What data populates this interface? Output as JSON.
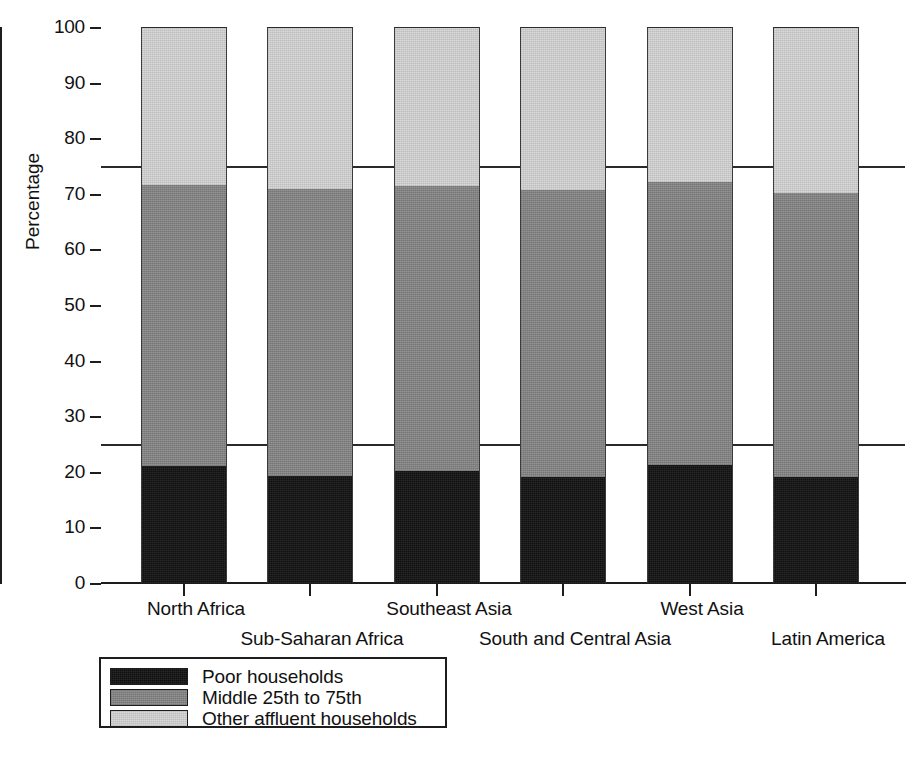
{
  "chart_data": {
    "type": "bar",
    "subtype": "stacked-100-percent",
    "title": "",
    "xlabel": "",
    "ylabel": "Percentage",
    "ylim": [
      0,
      100
    ],
    "yticks": [
      0,
      10,
      20,
      30,
      40,
      50,
      60,
      70,
      80,
      90,
      100
    ],
    "ytick_labels": [
      "0",
      "10",
      "20",
      "30",
      "40",
      "50",
      "60",
      "70",
      "80",
      "90",
      "100"
    ],
    "grid": false,
    "reference_lines": [
      25,
      75
    ],
    "legend_position": "below-left",
    "categories": [
      "North Africa",
      "Sub-Saharan Africa",
      "Southeast Asia",
      "South and Central Asia",
      "West Asia",
      "Latin America"
    ],
    "series": [
      {
        "name": "Poor households",
        "color": "#111111",
        "values": [
          21.0,
          19.2,
          20.1,
          19.1,
          21.3,
          19.0
        ]
      },
      {
        "name": "Middle 25th to 75th",
        "color": "#878787",
        "values": [
          50.5,
          51.6,
          51.3,
          51.6,
          50.8,
          51.1
        ]
      },
      {
        "name": "Other affluent households",
        "color": "#d3d3d3",
        "values": [
          28.5,
          29.2,
          28.6,
          29.3,
          27.9,
          29.9
        ]
      }
    ],
    "cumulative_tops": [
      [
        21.0,
        71.5,
        100
      ],
      [
        19.2,
        70.8,
        100
      ],
      [
        20.1,
        71.4,
        100
      ],
      [
        19.1,
        70.7,
        100
      ],
      [
        21.3,
        72.1,
        100
      ],
      [
        19.0,
        70.1,
        100
      ]
    ]
  },
  "axis": {
    "y_title": "Percentage",
    "y_ticks": [
      {
        "value": 100,
        "label": "100"
      },
      {
        "value": 90,
        "label": "90"
      },
      {
        "value": 80,
        "label": "80"
      },
      {
        "value": 70,
        "label": "70"
      },
      {
        "value": 60,
        "label": "60"
      },
      {
        "value": 50,
        "label": "50"
      },
      {
        "value": 40,
        "label": "40"
      },
      {
        "value": 30,
        "label": "30"
      },
      {
        "value": 20,
        "label": "20"
      },
      {
        "value": 10,
        "label": "10"
      },
      {
        "value": 0,
        "label": "0"
      }
    ]
  },
  "categories_layout": [
    {
      "label": "North Africa",
      "row": "a",
      "center_px": 196
    },
    {
      "label": "Sub-Saharan Africa",
      "row": "b",
      "center_px": 322
    },
    {
      "label": "Southeast Asia",
      "row": "a",
      "center_px": 449
    },
    {
      "label": "South and Central Asia",
      "row": "b",
      "center_px": 575
    },
    {
      "label": "West Asia",
      "row": "a",
      "center_px": 702
    },
    {
      "label": "Latin America",
      "row": "b",
      "center_px": 828
    }
  ],
  "legend": {
    "items": [
      {
        "label": "Poor households",
        "color": "#111111",
        "swatch": "poor-swatch"
      },
      {
        "label": "Middle 25th to 75th",
        "color": "#878787",
        "swatch": "middle-swatch"
      },
      {
        "label": "Other affluent households",
        "color": "#d3d3d3",
        "swatch": "affluent-swatch"
      }
    ]
  },
  "colors": {
    "poor": "#111111",
    "middle": "#878787",
    "affluent": "#d3d3d3",
    "axis": "#1d1d1d",
    "background": "#ffffff"
  }
}
